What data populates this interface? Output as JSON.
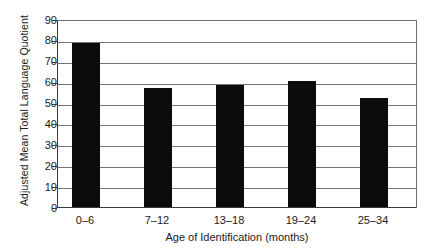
{
  "chart_data": {
    "type": "bar",
    "title": "",
    "categories": [
      "0–6",
      "7–12",
      "13–18",
      "19–24",
      "25–34"
    ],
    "values": [
      78.5,
      57,
      58.5,
      60.5,
      52
    ],
    "series": [
      {
        "name": "Adjusted Mean Total Language Quotient",
        "values": [
          78.5,
          57,
          58.5,
          60.5,
          52
        ]
      }
    ],
    "xlabel": "Age of Identification (months)",
    "ylabel": "Adjusted Mean Total Language Quotient",
    "ylim": [
      0,
      90
    ],
    "ytick_values": [
      0,
      10,
      20,
      30,
      40,
      50,
      60,
      70,
      80,
      90
    ],
    "yticks": [
      "0",
      "10",
      "20",
      "30",
      "40",
      "50",
      "60",
      "70",
      "80",
      "90"
    ],
    "grid": true,
    "grid_axis": "y",
    "legend": false,
    "legend_position": "none",
    "bar_color": "#0c0c0c",
    "grid_color": "#737373",
    "axis_color": "#3a3a3a",
    "background_color": "#ffffff"
  }
}
